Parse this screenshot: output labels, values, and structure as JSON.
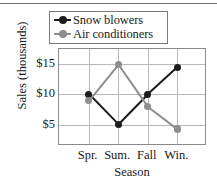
{
  "chart_data": {
    "type": "line",
    "title": "",
    "xlabel": "Season",
    "ylabel": "Sales (thousands)",
    "categories": [
      "Spr.",
      "Sum.",
      "Fall",
      "Win."
    ],
    "yticks": [
      "$5",
      "$10",
      "$15"
    ],
    "ytick_values": [
      5,
      10,
      15
    ],
    "ylim": [
      1.5,
      17.5
    ],
    "grid": true,
    "legend_position": "top",
    "series": [
      {
        "name": "Snow blowers",
        "color": "#1c1c1c",
        "values": [
          10,
          5,
          10,
          14.5
        ]
      },
      {
        "name": "Air conditioners",
        "color": "#8e8e8e",
        "values": [
          9,
          15,
          8,
          4.3
        ]
      }
    ]
  }
}
